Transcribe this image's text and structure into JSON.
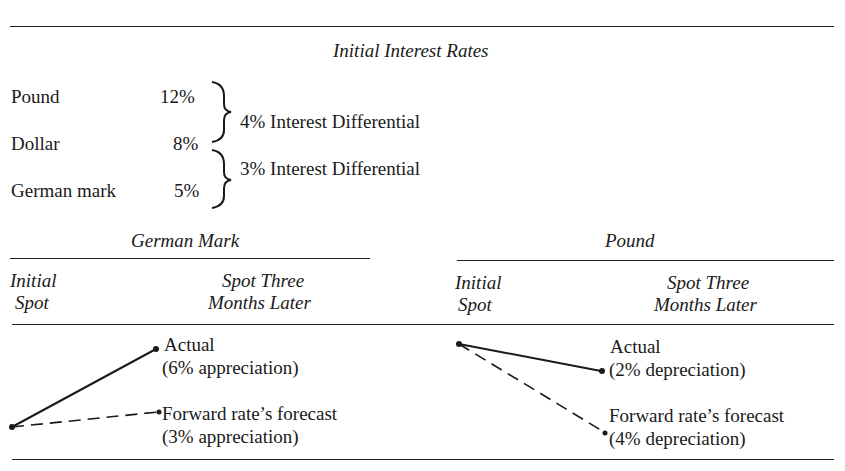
{
  "title": "Initial Interest Rates",
  "rates": [
    {
      "currency": "Pound",
      "rate": "12%"
    },
    {
      "currency": "Dollar",
      "rate": "8%"
    },
    {
      "currency": "German mark",
      "rate": "5%"
    }
  ],
  "differentials": [
    {
      "label": "4% Interest Differential"
    },
    {
      "label": "3% Interest Differential"
    }
  ],
  "panels": [
    {
      "name": "German Mark",
      "col_initial_line1": "Initial",
      "col_initial_line2": "Spot",
      "col_later_line1": "Spot Three",
      "col_later_line2": "Months Later",
      "actual_label": "Actual",
      "actual_value": "(6% appreciation)",
      "forecast_label": "Forward rate’s forecast",
      "forecast_value": "(3% appreciation)"
    },
    {
      "name": "Pound",
      "col_initial_line1": "Initial",
      "col_initial_line2": "Spot",
      "col_later_line1": "Spot Three",
      "col_later_line2": "Months Later",
      "actual_label": "Actual",
      "actual_value": "(2% depreciation)",
      "forecast_label": "Forward rate’s forecast",
      "forecast_value": "(4% depreciation)"
    }
  ],
  "colors": {
    "ink": "#1a1a1a",
    "background": "#ffffff"
  }
}
